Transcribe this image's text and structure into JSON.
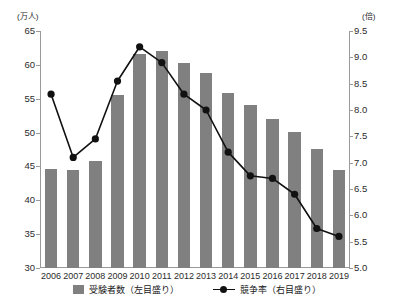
{
  "chart_data": {
    "type": "bar",
    "title": "",
    "subtitle": "",
    "xlabel": "",
    "ylabel": "",
    "categories": [
      "2006",
      "2007",
      "2008",
      "2009",
      "2010",
      "2011",
      "2012",
      "2013",
      "2014",
      "2015",
      "2016",
      "2017",
      "2018",
      "2019"
    ],
    "left_axis": {
      "unit": "(万人)",
      "label": "受験者数",
      "ylim": [
        30,
        65
      ],
      "ticks": [
        30,
        35,
        40,
        45,
        50,
        55,
        60,
        65
      ],
      "tick_labels": [
        "30",
        "35",
        "40",
        "45",
        "50",
        "55",
        "60",
        "65"
      ]
    },
    "right_axis": {
      "unit": "(倍)",
      "label": "競争率",
      "ylim": [
        5.0,
        9.5
      ],
      "ticks": [
        5.0,
        5.5,
        6.0,
        6.5,
        7.0,
        7.5,
        8.0,
        8.5,
        9.0,
        9.5
      ],
      "tick_labels": [
        "5.0",
        "5.5",
        "6.0",
        "6.5",
        "7.0",
        "7.5",
        "8.0",
        "8.5",
        "9.0",
        "9.5"
      ]
    },
    "grid": false,
    "legend_position": "bottom",
    "series": [
      {
        "name": "受験者数（左目盛り）",
        "short_name": "受験者数",
        "type": "bar",
        "axis": "left",
        "color": "#808080",
        "values": [
          44.6,
          44.5,
          45.8,
          55.5,
          61.6,
          62.0,
          60.3,
          58.8,
          55.8,
          54.1,
          52.0,
          50.1,
          47.6,
          44.5
        ]
      },
      {
        "name": "競争率（右目盛り）",
        "short_name": "競争率",
        "type": "line",
        "axis": "right",
        "color": "#111111",
        "values": [
          8.3,
          7.1,
          7.45,
          8.55,
          9.2,
          8.9,
          8.3,
          8.0,
          7.2,
          6.75,
          6.7,
          6.4,
          5.75,
          5.6
        ]
      }
    ]
  },
  "legend": {
    "items": [
      {
        "label": "受験者数（左目盛り）",
        "marker": "bar-swatch"
      },
      {
        "label": "競争率（右目盛り）",
        "marker": "line-marker"
      }
    ]
  }
}
